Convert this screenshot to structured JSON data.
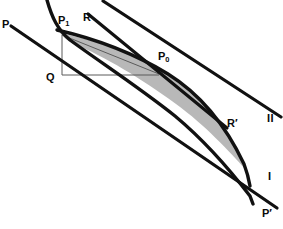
{
  "figure": {
    "background_color": "#ffffff",
    "stroke_color": "#111111",
    "shaded_region_color": "#b8b8b8",
    "thin_line_color": "#4a4a4a",
    "width": 283,
    "height": 229
  },
  "labels": {
    "p": "P",
    "p1_base": "P",
    "p1_sub": "1",
    "r": "R",
    "p0_base": "P",
    "p0_sub": "0",
    "q": "Q",
    "r_prime": "R′",
    "line_two": "II",
    "line_one": "I",
    "p_prime": "P′"
  },
  "geometry": {
    "points": [
      {
        "name": "P",
        "x": 3,
        "y": 25
      },
      {
        "name": "P1",
        "x": 60,
        "y": 22
      },
      {
        "name": "R",
        "x": 85,
        "y": 19
      },
      {
        "name": "P0",
        "x": 161,
        "y": 58
      },
      {
        "name": "Q",
        "x": 48,
        "y": 74
      },
      {
        "name": "R'",
        "x": 229,
        "y": 124
      },
      {
        "name": "II",
        "x": 268,
        "y": 119
      },
      {
        "name": "I",
        "x": 269,
        "y": 177
      },
      {
        "name": "P'",
        "x": 264,
        "y": 214
      }
    ],
    "curves": [
      {
        "name": "upper-curve",
        "type": "bezier",
        "from": [
          47,
          0
        ],
        "to": [
          252,
          229
        ]
      },
      {
        "name": "lower-curve",
        "type": "bezier",
        "from": [
          57,
          0
        ],
        "to": [
          249,
          195
        ]
      },
      {
        "name": "tangent-P-Pprime",
        "type": "line",
        "from": [
          10,
          26
        ],
        "to": [
          277,
          208
        ]
      },
      {
        "name": "tangent-R-Rprime",
        "type": "line",
        "from": [
          88,
          15
        ],
        "to": [
          228,
          128
        ]
      },
      {
        "name": "line-II",
        "type": "line",
        "from": [
          103,
          2
        ],
        "to": [
          281,
          117
        ]
      }
    ],
    "thin_lines": [
      {
        "name": "vertical-drop",
        "from": [
          62,
          36
        ],
        "to": [
          62,
          75
        ]
      },
      {
        "name": "horizontal-base",
        "from": [
          58,
          75
        ],
        "to": [
          158,
          75
        ]
      },
      {
        "name": "chord-P1-P0",
        "from": [
          62,
          36
        ],
        "to": [
          158,
          73
        ]
      }
    ]
  }
}
